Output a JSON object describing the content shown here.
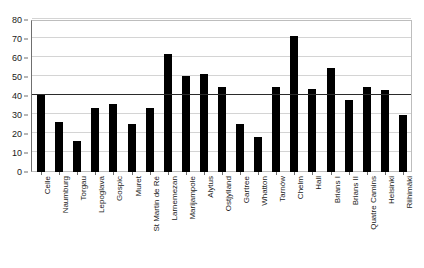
{
  "chart_data": {
    "type": "bar",
    "title": "",
    "subtitle": "",
    "xlabel": "",
    "ylabel": "",
    "ylim": [
      0,
      80
    ],
    "ytick_step": 10,
    "yticks": [
      0,
      10,
      20,
      30,
      40,
      50,
      60,
      70,
      80
    ],
    "grid": true,
    "legend": false,
    "legend_position": "none",
    "bar_color": "#000000",
    "gridline_color": "#d4d4d4",
    "axis_color": "#6f6f6f",
    "reference_line": {
      "value": 40,
      "color": "#2b2b2b",
      "label": ""
    },
    "categories": [
      "Celle",
      "Naumburg",
      "Torgau",
      "Lepoglava",
      "Gospic",
      "Muret",
      "St Martin de Ré",
      "Larnemezan",
      "Marijampole",
      "Alytus",
      "Ostjylland",
      "Gartree",
      "Whatton",
      "Tarnów",
      "Chelm",
      "Hall",
      "Brians I",
      "Brians II",
      "Quatre Camins",
      "Helsinki",
      "Riihimäki"
    ],
    "values": [
      40.5,
      26.5,
      16.2,
      33.8,
      35.8,
      25.2,
      33.5,
      62.2,
      50.5,
      51.7,
      44.5,
      25.5,
      18.5,
      44.7,
      71.5,
      43.7,
      54.6,
      37.9,
      44.7,
      43.2,
      30.2
    ]
  }
}
